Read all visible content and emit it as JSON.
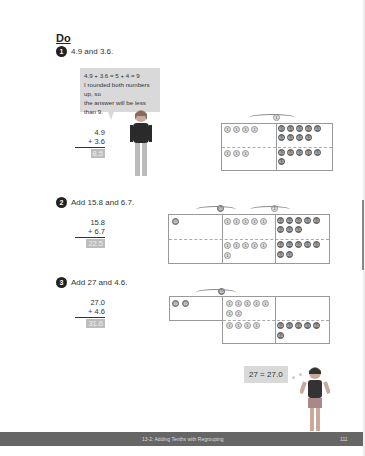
{
  "section": {
    "heading": "Do"
  },
  "questions": [
    {
      "number": "1",
      "text": "4.9 and 3.6.",
      "top": "4.9",
      "bottom": "+  3.6",
      "answer": "8.5",
      "bubble": {
        "line1": "4.9 + 3.6 = 5 + 4 = 9",
        "line2": "I rounded both numbers up, so",
        "line3": "the answer will be less than 9."
      }
    },
    {
      "number": "2",
      "text": "Add 15.8 and 6.7.",
      "top": "15.8",
      "bottom": "+  6.7",
      "answer": "22.5"
    },
    {
      "number": "3",
      "text": "Add 27 and 4.6.",
      "top": "27.0",
      "bottom": "+  4.6",
      "answer": "31.6",
      "thought": "27 = 27.0"
    }
  ],
  "discs": {
    "one": "1",
    "tenth": "0.1",
    "ten": "10"
  },
  "footer": {
    "title": "13-2: Adding Tenths with Regrouping",
    "page": "111"
  },
  "colors": {
    "footer_bg": "#666666",
    "answer_bg": "#bdbdbd",
    "bubble_bg": "#d9d9d9"
  }
}
